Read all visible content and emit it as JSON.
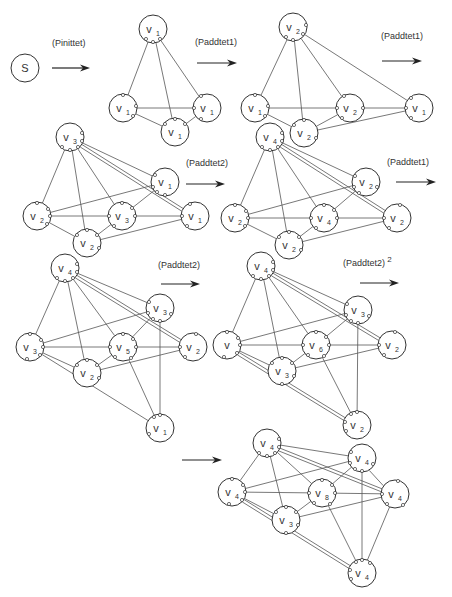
{
  "colors": {
    "stroke": "#333333",
    "background": "#ffffff"
  },
  "arrows": [
    {
      "id": "a1",
      "label": "(Pinittet)",
      "sup": "",
      "x1": 52,
      "y1": 68,
      "x2": 90,
      "label_x": 52,
      "label_y": 46
    },
    {
      "id": "a2",
      "label": "(Paddtet1)",
      "sup": "",
      "x1": 197,
      "y1": 63,
      "x2": 237,
      "label_x": 195,
      "label_y": 45
    },
    {
      "id": "a3",
      "label": "(Paddtet1)",
      "sup": "",
      "x1": 382,
      "y1": 61,
      "x2": 422,
      "label_x": 381,
      "label_y": 39
    },
    {
      "id": "a4",
      "label": "(Paddtet2)",
      "sup": "",
      "x1": 186,
      "y1": 184,
      "x2": 225,
      "label_x": 186,
      "label_y": 166
    },
    {
      "id": "a5",
      "label": "(Paddtet1)",
      "sup": "",
      "x1": 396,
      "y1": 182,
      "x2": 436,
      "label_x": 387,
      "label_y": 165
    },
    {
      "id": "a6",
      "label": "(Paddtet2)",
      "sup": "",
      "x1": 161,
      "y1": 284,
      "x2": 200,
      "label_x": 158,
      "label_y": 268
    },
    {
      "id": "a7",
      "label": "(Paddtet2)",
      "sup": "2",
      "x1": 360,
      "y1": 283,
      "x2": 399,
      "label_x": 343,
      "label_y": 266
    },
    {
      "id": "a8",
      "label": "",
      "sup": "",
      "x1": 182,
      "y1": 460,
      "x2": 222,
      "label_x": 0,
      "label_y": 0
    }
  ],
  "nodes": [
    {
      "id": "s",
      "x": 25,
      "y": 68,
      "base": "S",
      "sub": "",
      "ports": []
    },
    {
      "id": "p2a",
      "x": 153,
      "y": 29,
      "base": "v",
      "sub": "1",
      "ports": [
        [
          -7,
          10
        ],
        [
          0,
          13
        ],
        [
          7,
          10
        ]
      ]
    },
    {
      "id": "p2b",
      "x": 123,
      "y": 108,
      "base": "v",
      "sub": "1",
      "ports": [
        [
          0,
          -13
        ],
        [
          13,
          -2
        ],
        [
          10,
          8
        ]
      ]
    },
    {
      "id": "p2c",
      "x": 207,
      "y": 108,
      "base": "v",
      "sub": "1",
      "ports": [
        [
          -6,
          -12
        ],
        [
          -13,
          0
        ],
        [
          -6,
          11
        ]
      ]
    },
    {
      "id": "p2d",
      "x": 175,
      "y": 132,
      "base": "v",
      "sub": "1",
      "ports": [
        [
          -10,
          -8
        ],
        [
          0,
          -13
        ],
        [
          10,
          -8
        ]
      ]
    },
    {
      "id": "p3a",
      "x": 293,
      "y": 27,
      "base": "v",
      "sub": "2",
      "ports": [
        [
          -7,
          10
        ],
        [
          0,
          13
        ],
        [
          10,
          7
        ],
        [
          13,
          -2
        ]
      ]
    },
    {
      "id": "p3b",
      "x": 255,
      "y": 108,
      "base": "v",
      "sub": "1",
      "ports": [
        [
          0,
          -13
        ],
        [
          13,
          -2
        ],
        [
          10,
          8
        ]
      ]
    },
    {
      "id": "p3c",
      "x": 350,
      "y": 108,
      "base": "v",
      "sub": "2",
      "ports": [
        [
          -6,
          -12
        ],
        [
          -13,
          0
        ],
        [
          13,
          0
        ],
        [
          -8,
          10
        ]
      ]
    },
    {
      "id": "p3d",
      "x": 304,
      "y": 133,
      "base": "v",
      "sub": "2",
      "ports": [
        [
          0,
          -13
        ],
        [
          -10,
          -8
        ],
        [
          12,
          5
        ]
      ]
    },
    {
      "id": "p3e",
      "x": 419,
      "y": 108,
      "base": "v",
      "sub": "1",
      "ports": [
        [
          -8,
          -10
        ],
        [
          -13,
          0
        ],
        [
          -8,
          10
        ]
      ]
    },
    {
      "id": "p4a",
      "x": 70,
      "y": 137,
      "base": "v",
      "sub": "3",
      "ports": [
        [
          -8,
          10
        ],
        [
          0,
          13
        ],
        [
          8,
          10
        ],
        [
          12,
          4
        ],
        [
          12,
          -4
        ]
      ]
    },
    {
      "id": "p4b",
      "x": 165,
      "y": 182,
      "base": "v",
      "sub": "1",
      "ports": [
        [
          -10,
          -7
        ],
        [
          -12,
          5
        ],
        [
          -8,
          10
        ],
        [
          0,
          13
        ]
      ]
    },
    {
      "id": "p4c",
      "x": 37,
      "y": 216,
      "base": "v",
      "sub": "2",
      "ports": [
        [
          0,
          -13
        ],
        [
          11,
          -7
        ],
        [
          13,
          0
        ],
        [
          10,
          8
        ]
      ]
    },
    {
      "id": "p4d",
      "x": 122,
      "y": 216,
      "base": "v",
      "sub": "3",
      "ports": [
        [
          0,
          -13
        ],
        [
          -13,
          0
        ],
        [
          13,
          0
        ],
        [
          -8,
          10
        ],
        [
          10,
          -8
        ]
      ]
    },
    {
      "id": "p4e",
      "x": 195,
      "y": 216,
      "base": "v",
      "sub": "1",
      "ports": [
        [
          -5,
          -12
        ],
        [
          -13,
          0
        ],
        [
          -8,
          10
        ]
      ]
    },
    {
      "id": "p4f",
      "x": 87,
      "y": 243,
      "base": "v",
      "sub": "2",
      "ports": [
        [
          -10,
          -8
        ],
        [
          0,
          -13
        ],
        [
          10,
          -8
        ],
        [
          12,
          5
        ]
      ]
    },
    {
      "id": "p5a",
      "x": 270,
      "y": 137,
      "base": "v",
      "sub": "4",
      "ports": [
        [
          -8,
          10
        ],
        [
          0,
          13
        ],
        [
          8,
          10
        ],
        [
          12,
          4
        ],
        [
          12,
          -4
        ]
      ]
    },
    {
      "id": "p5b",
      "x": 366,
      "y": 182,
      "base": "v",
      "sub": "2",
      "ports": [
        [
          -11,
          -6
        ],
        [
          -12,
          5
        ],
        [
          -7,
          11
        ],
        [
          11,
          5
        ]
      ]
    },
    {
      "id": "p5c",
      "x": 235,
      "y": 218,
      "base": "v",
      "sub": "2",
      "ports": [
        [
          0,
          -13
        ],
        [
          11,
          -7
        ],
        [
          13,
          0
        ],
        [
          10,
          8
        ]
      ]
    },
    {
      "id": "p5d",
      "x": 324,
      "y": 218,
      "base": "v",
      "sub": "4",
      "ports": [
        [
          0,
          -13
        ],
        [
          -13,
          0
        ],
        [
          13,
          0
        ],
        [
          -8,
          10
        ],
        [
          10,
          -8
        ]
      ]
    },
    {
      "id": "p5e",
      "x": 397,
      "y": 218,
      "base": "v",
      "sub": "2",
      "ports": [
        [
          3,
          -13
        ],
        [
          -13,
          0
        ],
        [
          -8,
          10
        ]
      ]
    },
    {
      "id": "p5f",
      "x": 289,
      "y": 245,
      "base": "v",
      "sub": "2",
      "ports": [
        [
          -10,
          -8
        ],
        [
          0,
          -13
        ],
        [
          10,
          -8
        ],
        [
          12,
          5
        ]
      ]
    },
    {
      "id": "p6a",
      "x": 65,
      "y": 268,
      "base": "v",
      "sub": "4",
      "ports": [
        [
          -8,
          10
        ],
        [
          0,
          13
        ],
        [
          8,
          10
        ],
        [
          12,
          4
        ],
        [
          12,
          -4
        ]
      ]
    },
    {
      "id": "p6b",
      "x": 160,
      "y": 308,
      "base": "v",
      "sub": "3",
      "ports": [
        [
          -11,
          -6
        ],
        [
          -12,
          5
        ],
        [
          -7,
          11
        ],
        [
          0,
          13
        ],
        [
          11,
          6
        ]
      ]
    },
    {
      "id": "p6c",
      "x": 30,
      "y": 347,
      "base": "v",
      "sub": "3",
      "ports": [
        [
          0,
          -13
        ],
        [
          11,
          -7
        ],
        [
          13,
          0
        ],
        [
          10,
          8
        ],
        [
          -3,
          12
        ]
      ]
    },
    {
      "id": "p6d",
      "x": 123,
      "y": 347,
      "base": "v",
      "sub": "5",
      "ports": [
        [
          0,
          -13
        ],
        [
          -13,
          0
        ],
        [
          13,
          0
        ],
        [
          -8,
          10
        ],
        [
          10,
          -8
        ],
        [
          8,
          11
        ]
      ]
    },
    {
      "id": "p6e",
      "x": 193,
      "y": 347,
      "base": "v",
      "sub": "2",
      "ports": [
        [
          3,
          -13
        ],
        [
          -13,
          0
        ],
        [
          -8,
          10
        ]
      ]
    },
    {
      "id": "p6f",
      "x": 87,
      "y": 373,
      "base": "v",
      "sub": "2",
      "ports": [
        [
          -10,
          -8
        ],
        [
          0,
          -13
        ],
        [
          10,
          -8
        ],
        [
          12,
          5
        ]
      ]
    },
    {
      "id": "p6g",
      "x": 160,
      "y": 428,
      "base": "v",
      "sub": "1",
      "ports": [
        [
          -6,
          -11
        ],
        [
          0,
          -13
        ],
        [
          -11,
          6
        ]
      ]
    },
    {
      "id": "p7a",
      "x": 261,
      "y": 266,
      "base": "v",
      "sub": "4",
      "ports": [
        [
          -8,
          10
        ],
        [
          0,
          13
        ],
        [
          8,
          10
        ],
        [
          12,
          4
        ],
        [
          12,
          -4
        ]
      ]
    },
    {
      "id": "p7b",
      "x": 358,
      "y": 310,
      "base": "v",
      "sub": "3",
      "ports": [
        [
          -11,
          -6
        ],
        [
          -12,
          5
        ],
        [
          -7,
          11
        ],
        [
          0,
          13
        ],
        [
          11,
          6
        ]
      ]
    },
    {
      "id": "p7c",
      "x": 227,
      "y": 345,
      "base": "v",
      "sub": "",
      "ports": [
        [
          0,
          -13
        ],
        [
          11,
          -7
        ],
        [
          13,
          0
        ],
        [
          10,
          8
        ],
        [
          -3,
          12
        ]
      ]
    },
    {
      "id": "p7d",
      "x": 316,
      "y": 345,
      "base": "v",
      "sub": "6",
      "ports": [
        [
          0,
          -13
        ],
        [
          -13,
          0
        ],
        [
          13,
          0
        ],
        [
          -8,
          10
        ],
        [
          10,
          -8
        ],
        [
          8,
          11
        ]
      ]
    },
    {
      "id": "p7e",
      "x": 392,
      "y": 345,
      "base": "v",
      "sub": "2",
      "ports": [
        [
          3,
          -13
        ],
        [
          -13,
          0
        ],
        [
          -8,
          10
        ]
      ]
    },
    {
      "id": "p7f",
      "x": 282,
      "y": 371,
      "base": "v",
      "sub": "3",
      "ports": [
        [
          -10,
          -8
        ],
        [
          0,
          -13
        ],
        [
          10,
          -8
        ],
        [
          12,
          5
        ],
        [
          0,
          13
        ]
      ]
    },
    {
      "id": "p7g",
      "x": 357,
      "y": 425,
      "base": "v",
      "sub": "2",
      "ports": [
        [
          -6,
          -11
        ],
        [
          0,
          -13
        ],
        [
          -11,
          6
        ],
        [
          -12,
          -3
        ]
      ]
    },
    {
      "id": "p8a",
      "x": 267,
      "y": 443,
      "base": "v",
      "sub": "4",
      "ports": [
        [
          -8,
          10
        ],
        [
          0,
          13
        ],
        [
          8,
          10
        ],
        [
          12,
          4
        ],
        [
          12,
          -4
        ]
      ]
    },
    {
      "id": "p8b",
      "x": 362,
      "y": 458,
      "base": "v",
      "sub": "4",
      "ports": [
        [
          -11,
          -6
        ],
        [
          -12,
          5
        ],
        [
          -7,
          11
        ],
        [
          0,
          13
        ],
        [
          11,
          6
        ]
      ]
    },
    {
      "id": "p8c",
      "x": 232,
      "y": 492,
      "base": "v",
      "sub": "4",
      "ports": [
        [
          0,
          -13
        ],
        [
          11,
          -7
        ],
        [
          13,
          0
        ],
        [
          10,
          8
        ],
        [
          -3,
          12
        ]
      ]
    },
    {
      "id": "p8d",
      "x": 322,
      "y": 493,
      "base": "v",
      "sub": "8",
      "ports": [
        [
          0,
          -13
        ],
        [
          -13,
          0
        ],
        [
          13,
          0
        ],
        [
          -8,
          10
        ],
        [
          10,
          -8
        ],
        [
          8,
          11
        ]
      ]
    },
    {
      "id": "p8e",
      "x": 395,
      "y": 494,
      "base": "v",
      "sub": "4",
      "ports": [
        [
          3,
          -13
        ],
        [
          -13,
          0
        ],
        [
          -8,
          10
        ],
        [
          8,
          11
        ]
      ]
    },
    {
      "id": "p8f",
      "x": 286,
      "y": 520,
      "base": "v",
      "sub": "3",
      "ports": [
        [
          -10,
          -8
        ],
        [
          0,
          -13
        ],
        [
          10,
          -8
        ],
        [
          12,
          5
        ],
        [
          0,
          13
        ]
      ]
    },
    {
      "id": "p8g",
      "x": 362,
      "y": 573,
      "base": "v",
      "sub": "4",
      "ports": [
        [
          -6,
          -11
        ],
        [
          0,
          -13
        ],
        [
          -11,
          6
        ],
        [
          -12,
          -3
        ],
        [
          8,
          -10
        ]
      ]
    }
  ],
  "edges": [
    [
      "p2a",
      "p2b"
    ],
    [
      "p2a",
      "p2c"
    ],
    [
      "p2a",
      "p2d"
    ],
    [
      "p2b",
      "p2c"
    ],
    [
      "p2b",
      "p2d"
    ],
    [
      "p2d",
      "p2c"
    ],
    [
      "p3a",
      "p3b"
    ],
    [
      "p3a",
      "p3c"
    ],
    [
      "p3a",
      "p3d"
    ],
    [
      "p3a",
      "p3e"
    ],
    [
      "p3b",
      "p3c"
    ],
    [
      "p3b",
      "p3d"
    ],
    [
      "p3d",
      "p3c"
    ],
    [
      "p3c",
      "p3e"
    ],
    [
      "p3d",
      "p3e"
    ],
    [
      "p4a",
      "p4c"
    ],
    [
      "p4a",
      "p4d"
    ],
    [
      "p4a",
      "p4f"
    ],
    [
      "p4a",
      "p4b"
    ],
    [
      "p4a",
      "p4e"
    ],
    [
      "p4c",
      "p4b"
    ],
    [
      "p4c",
      "p4d"
    ],
    [
      "p4c",
      "p4f"
    ],
    [
      "p4f",
      "p4d"
    ],
    [
      "p4d",
      "p4b"
    ],
    [
      "p4d",
      "p4e"
    ],
    [
      "p4f",
      "p4e"
    ],
    [
      "p5a",
      "p5c"
    ],
    [
      "p5a",
      "p5d"
    ],
    [
      "p5a",
      "p5f"
    ],
    [
      "p5a",
      "p5b"
    ],
    [
      "p5a",
      "p5e"
    ],
    [
      "p5c",
      "p5b"
    ],
    [
      "p5c",
      "p5d"
    ],
    [
      "p5c",
      "p5f"
    ],
    [
      "p5f",
      "p5d"
    ],
    [
      "p5d",
      "p5b"
    ],
    [
      "p5d",
      "p5e"
    ],
    [
      "p5f",
      "p5e"
    ],
    [
      "p6a",
      "p6c"
    ],
    [
      "p6a",
      "p6d"
    ],
    [
      "p6a",
      "p6f"
    ],
    [
      "p6a",
      "p6b"
    ],
    [
      "p6a",
      "p6e"
    ],
    [
      "p6c",
      "p6b"
    ],
    [
      "p6c",
      "p6d"
    ],
    [
      "p6c",
      "p6f"
    ],
    [
      "p6f",
      "p6d"
    ],
    [
      "p6d",
      "p6b"
    ],
    [
      "p6d",
      "p6e"
    ],
    [
      "p6f",
      "p6e"
    ],
    [
      "p6c",
      "p6g"
    ],
    [
      "p6d",
      "p6g"
    ],
    [
      "p6b",
      "p6g"
    ],
    [
      "p7a",
      "p7c"
    ],
    [
      "p7a",
      "p7d"
    ],
    [
      "p7a",
      "p7f"
    ],
    [
      "p7a",
      "p7b"
    ],
    [
      "p7a",
      "p7e"
    ],
    [
      "p7c",
      "p7b"
    ],
    [
      "p7c",
      "p7d"
    ],
    [
      "p7c",
      "p7f"
    ],
    [
      "p7f",
      "p7d"
    ],
    [
      "p7d",
      "p7b"
    ],
    [
      "p7d",
      "p7e"
    ],
    [
      "p7f",
      "p7e"
    ],
    [
      "p7c",
      "p7g"
    ],
    [
      "p7d",
      "p7g"
    ],
    [
      "p7b",
      "p7g"
    ],
    [
      "p7c",
      "p7g",
      "offset"
    ],
    [
      "p8a",
      "p8c"
    ],
    [
      "p8a",
      "p8d"
    ],
    [
      "p8a",
      "p8f"
    ],
    [
      "p8a",
      "p8b"
    ],
    [
      "p8a",
      "p8e"
    ],
    [
      "p8c",
      "p8b"
    ],
    [
      "p8c",
      "p8d"
    ],
    [
      "p8c",
      "p8f"
    ],
    [
      "p8f",
      "p8d"
    ],
    [
      "p8d",
      "p8b"
    ],
    [
      "p8d",
      "p8e"
    ],
    [
      "p8f",
      "p8e"
    ],
    [
      "p8c",
      "p8g"
    ],
    [
      "p8d",
      "p8g"
    ],
    [
      "p8b",
      "p8g"
    ],
    [
      "p8c",
      "p8g",
      "offset"
    ],
    [
      "p8e",
      "p8g"
    ],
    [
      "p8b",
      "p8e",
      "offset"
    ]
  ],
  "double_edges": [
    "p4a-p4e",
    "p5a-p5e",
    "p6a-p6e",
    "p7a-p7e",
    "p8a-p8e"
  ]
}
